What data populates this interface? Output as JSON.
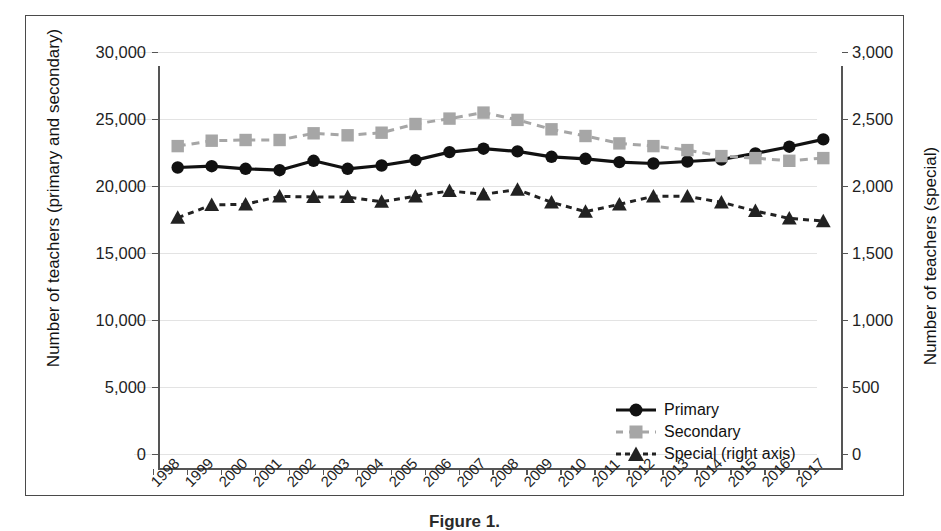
{
  "figure": {
    "caption": "Figure 1."
  },
  "chart_data": {
    "type": "line",
    "title": "",
    "xlabel": "",
    "ylabel": "Number of teachers (primary and secondary)",
    "y2label": "Number of teachers (special)",
    "grid": true,
    "legend_position": "bottom-right",
    "x": [
      "1998",
      "1999",
      "2000",
      "2001",
      "2002",
      "2003",
      "2004",
      "2005",
      "2006",
      "2007",
      "2008",
      "2009",
      "2010",
      "2011",
      "2012",
      "2013",
      "2014",
      "2015",
      "2016",
      "2017"
    ],
    "ylim": [
      0,
      30000
    ],
    "yticks": [
      "0",
      "5,000",
      "10,000",
      "15,000",
      "20,000",
      "25,000",
      "30,000"
    ],
    "ytick_values": [
      0,
      5000,
      10000,
      15000,
      20000,
      25000,
      30000
    ],
    "y2lim": [
      0,
      3000
    ],
    "y2ticks": [
      "0",
      "500",
      "1,000",
      "1,500",
      "2,000",
      "2,500",
      "3,000"
    ],
    "y2tick_values": [
      0,
      500,
      1000,
      1500,
      2000,
      2500,
      3000
    ],
    "series": [
      {
        "name": "Primary",
        "axis": "left",
        "color": "#111111",
        "marker": "circle",
        "linestyle": "solid",
        "values": [
          22500,
          22600,
          22400,
          22300,
          23000,
          22400,
          22650,
          23050,
          23650,
          23900,
          23700,
          23300,
          23150,
          22900,
          22800,
          22950,
          23100,
          23550,
          24050,
          24600
        ]
      },
      {
        "name": "Secondary",
        "axis": "left",
        "color": "#a6a6a6",
        "marker": "square",
        "linestyle": "dashed",
        "values": [
          24100,
          24500,
          24550,
          24550,
          25050,
          24900,
          25100,
          25750,
          26150,
          26600,
          26050,
          25350,
          24850,
          24300,
          24100,
          23800,
          23350,
          23200,
          23000,
          23200
        ]
      },
      {
        "name": "Special (right axis)",
        "axis": "right",
        "color": "#222222",
        "marker": "triangle",
        "linestyle": "dashed",
        "values": [
          1875,
          1970,
          1975,
          2035,
          2030,
          2030,
          1995,
          2035,
          2075,
          2050,
          2085,
          1990,
          1920,
          1975,
          2035,
          2035,
          1990,
          1925,
          1870,
          1850
        ]
      }
    ]
  },
  "legend": {
    "items": [
      {
        "label": "Primary"
      },
      {
        "label": "Secondary"
      },
      {
        "label": "Special (right axis)"
      }
    ]
  }
}
